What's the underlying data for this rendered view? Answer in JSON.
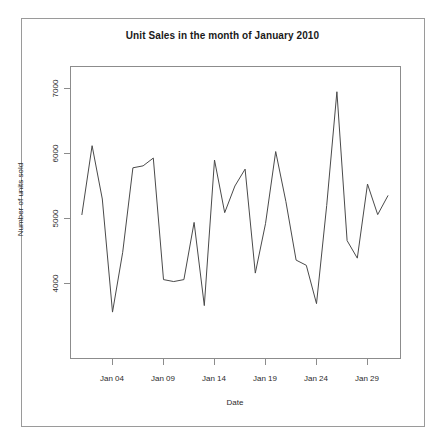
{
  "figure": {
    "title": "Unit Sales in the month of January 2010",
    "background_color": "#ffffff",
    "frame_color": "#9a9a9a",
    "line_color": "#4a4a4a"
  },
  "chart_data": {
    "type": "line",
    "title": "Unit Sales in the month of January 2010",
    "xlabel": "Date",
    "ylabel": "Number of units sold",
    "grid": false,
    "legend": null,
    "xlim": [
      "Jan 01",
      "Jan 31"
    ],
    "ylim": [
      3450,
      7000
    ],
    "yticks": [
      4000,
      5000,
      6000,
      7000
    ],
    "ytick_labels": [
      "4000",
      "5000",
      "6000",
      "7000"
    ],
    "xticks": [
      "Jan 04",
      "Jan 09",
      "Jan 14",
      "Jan 19",
      "Jan 24",
      "Jan 29"
    ],
    "xtick_labels": [
      "Jan 04",
      "Jan 09",
      "Jan 14",
      "Jan 19",
      "Jan 24",
      "Jan 29"
    ],
    "x": [
      "Jan 01",
      "Jan 02",
      "Jan 03",
      "Jan 04",
      "Jan 05",
      "Jan 06",
      "Jan 07",
      "Jan 08",
      "Jan 09",
      "Jan 10",
      "Jan 11",
      "Jan 12",
      "Jan 13",
      "Jan 14",
      "Jan 15",
      "Jan 16",
      "Jan 17",
      "Jan 18",
      "Jan 19",
      "Jan 20",
      "Jan 21",
      "Jan 22",
      "Jan 23",
      "Jan 24",
      "Jan 25",
      "Jan 26",
      "Jan 27",
      "Jan 28",
      "Jan 29",
      "Jan 30",
      "Jan 31"
    ],
    "values": [
      5060,
      6120,
      5300,
      3560,
      4480,
      5780,
      5810,
      5930,
      4060,
      4030,
      4060,
      4940,
      3660,
      5900,
      5090,
      5500,
      5760,
      4160,
      4920,
      6030,
      5260,
      4360,
      4280,
      3690,
      5200,
      6950,
      4660,
      4390,
      5530,
      5060,
      5350
    ]
  },
  "axes": {
    "y_axis_title": "Number of units sold",
    "x_axis_title": "Date"
  }
}
